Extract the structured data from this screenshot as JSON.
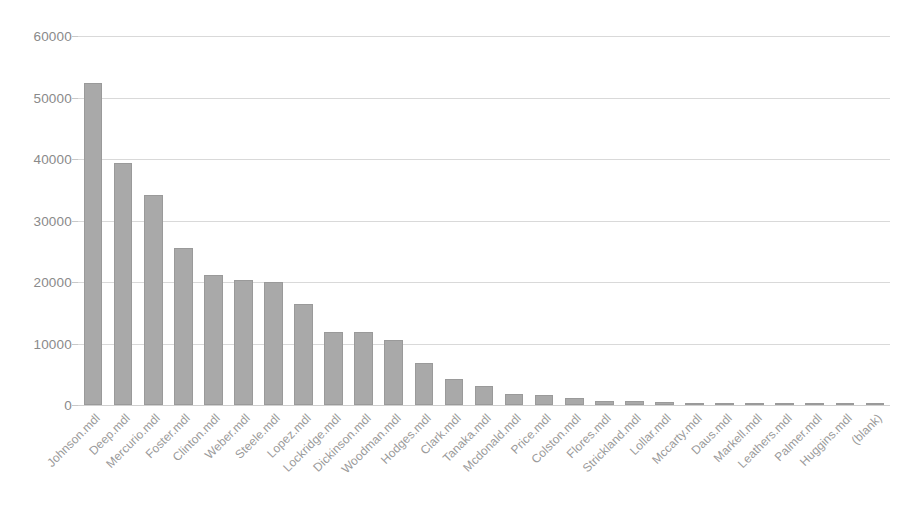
{
  "chart_data": {
    "type": "bar",
    "title": "",
    "subtitle": "",
    "xlabel": "",
    "ylabel": "",
    "ylim": [
      0,
      60000
    ],
    "ytick_interval": 10000,
    "yticks": [
      "0",
      "10000",
      "20000",
      "30000",
      "40000",
      "50000",
      "60000"
    ],
    "grid": true,
    "legend": false,
    "legend_position": "none",
    "series_name": "",
    "bar_color": "#a9a9a9",
    "bar_border_color": "#9a9a9a",
    "gridline_color": "#d9d9d9",
    "tick_label_color": "#8a8a8a",
    "category_label_color": "#9a9a9a",
    "category_label_rotation": -45,
    "categories": [
      "Johnson.mdl",
      "Deep.mdl",
      "Mercurio.mdl",
      "Foster.mdl",
      "Clinton.mdl",
      "Weber.mdl",
      "Steele.mdl",
      "Lopez.mdl",
      "Lockridge.mdl",
      "Dickinson.mdl",
      "Woodman.mdl",
      "Hodges.mdl",
      "Clark.mdl",
      "Tanaka.mdl",
      "Mcdonald.mdl",
      "Price.mdl",
      "Colston.mdl",
      "Flores.mdl",
      "Strickland.mdl",
      "Lollar.mdl",
      "Mccarty.mdl",
      "Daus.mdl",
      "Markell.mdl",
      "Leathers.mdl",
      "Palmer.mdl",
      "Huggins.mdl",
      "(blank)"
    ],
    "values": [
      52400,
      39300,
      34100,
      25600,
      21200,
      20300,
      20000,
      16400,
      11900,
      11800,
      10600,
      6800,
      4300,
      3100,
      1800,
      1600,
      1100,
      700,
      600,
      500,
      400,
      250,
      200,
      150,
      100,
      80,
      60
    ]
  }
}
